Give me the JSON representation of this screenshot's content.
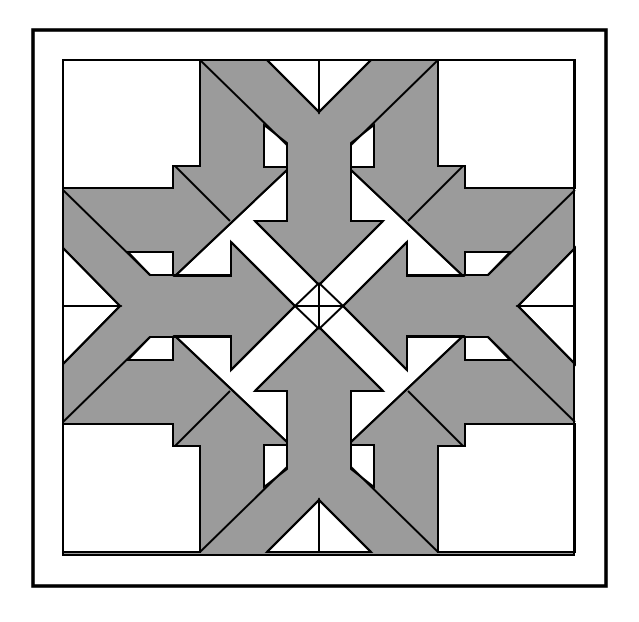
{
  "title": "Quilt block pattern with four arrow arms",
  "colors": {
    "background": "#ffffff",
    "gray": "#9b9b9b",
    "white": "#ffffff",
    "line": "#000000"
  },
  "frame": {
    "outer": {
      "x": 33,
      "y": 30,
      "w": 573,
      "h": 556,
      "stroke": 3.5
    },
    "inner": {
      "x": 63,
      "y": 60,
      "w": 511,
      "h": 495,
      "stroke": 2
    }
  },
  "center": {
    "x": 319,
    "y": 306
  },
  "quadrant": {
    "white_polygons": [
      [
        [
          63,
          60
        ],
        [
          200,
          60
        ],
        [
          200,
          166
        ],
        [
          173,
          166
        ],
        [
          173,
          188
        ],
        [
          63,
          188
        ]
      ],
      [
        [
          267,
          60
        ],
        [
          319,
          60
        ],
        [
          319,
          112
        ]
      ],
      [
        [
          63,
          248
        ],
        [
          63,
          306
        ],
        [
          120,
          306
        ]
      ],
      [
        [
          264,
          125
        ],
        [
          287,
          143
        ],
        [
          287,
          167
        ],
        [
          264,
          167
        ]
      ],
      [
        [
          128,
          252
        ],
        [
          173,
          252
        ],
        [
          173,
          275
        ],
        [
          150,
          275
        ]
      ],
      [
        [
          287,
          170
        ],
        [
          287,
          221
        ],
        [
          255,
          221
        ],
        [
          319,
          285
        ],
        [
          319,
          306
        ],
        [
          295,
          306
        ],
        [
          231,
          242
        ],
        [
          231,
          276
        ],
        [
          175,
          276
        ]
      ]
    ],
    "lines": [
      [
        [
          200,
          60
        ],
        [
          287,
          145
        ]
      ],
      [
        [
          267,
          60
        ],
        [
          319,
          112
        ]
      ],
      [
        [
          63,
          190
        ],
        [
          150,
          275
        ]
      ],
      [
        [
          63,
          248
        ],
        [
          120,
          306
        ]
      ],
      [
        [
          175,
          166
        ],
        [
          230,
          221
        ]
      ],
      [
        [
          287,
          170
        ],
        [
          175,
          276
        ]
      ],
      [
        [
          255,
          221
        ],
        [
          319,
          285
        ]
      ],
      [
        [
          231,
          242
        ],
        [
          295,
          306
        ]
      ],
      [
        [
          319,
          283
        ],
        [
          295,
          306
        ]
      ]
    ],
    "polylines": [
      [
        [
          200,
          60
        ],
        [
          200,
          166
        ],
        [
          173,
          166
        ],
        [
          173,
          188
        ],
        [
          63,
          188
        ]
      ],
      [
        [
          264,
          125
        ],
        [
          264,
          167
        ],
        [
          287,
          167
        ],
        [
          287,
          221
        ],
        [
          255,
          221
        ]
      ],
      [
        [
          128,
          252
        ],
        [
          173,
          252
        ],
        [
          173,
          275
        ],
        [
          231,
          275
        ],
        [
          231,
          242
        ]
      ],
      [
        [
          287,
          143
        ],
        [
          287,
          167
        ]
      ]
    ]
  }
}
